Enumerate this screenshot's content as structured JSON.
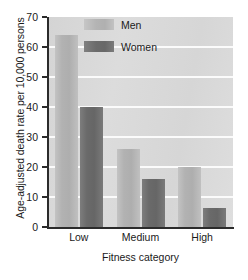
{
  "chart_data": {
    "type": "bar",
    "title": "",
    "xlabel": "Fitness category",
    "ylabel": "Age-adjusted death rate per 10,000 persons",
    "categories": [
      "Low",
      "Medium",
      "High"
    ],
    "series": [
      {
        "name": "Men",
        "values": [
          64,
          26,
          20
        ]
      },
      {
        "name": "Women",
        "values": [
          40,
          16,
          6.5
        ]
      }
    ],
    "ylim": [
      0,
      70
    ],
    "ytick_labels": [
      "0",
      "10",
      "20",
      "30",
      "40",
      "50",
      "60",
      "70"
    ],
    "ytick_values": [
      0,
      10,
      20,
      30,
      40,
      50,
      60,
      70
    ],
    "grid": true,
    "legend_position": "upper-center-right",
    "colors": {
      "men": "#b2b2b2",
      "women": "#6a6a6a",
      "plot_background": "#d9d9d9",
      "gridline": "#fbfbfb",
      "axis": "#2b2b2b",
      "text": "#1a1a1a",
      "figure_background": "#ffffff"
    }
  }
}
